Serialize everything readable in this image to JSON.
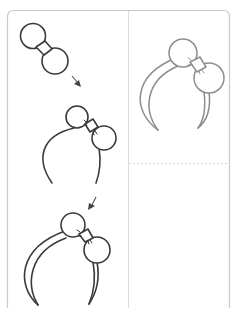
{
  "worksheet": {
    "subject": "how to draw a headband with bow",
    "steps": [
      {
        "index": 1,
        "description": "bow-two-circles-with-knot"
      },
      {
        "index": 2,
        "description": "add-single-line-headband-arc"
      },
      {
        "index": 3,
        "description": "double-line-headband"
      }
    ],
    "final_preview": {
      "description": "finished-headband-grey-outline"
    },
    "arrows": [
      {
        "from_step": 1,
        "to_step": 2,
        "icon": "arrow-down-right-icon"
      },
      {
        "from_step": 2,
        "to_step": 3,
        "icon": "arrow-down-left-icon"
      }
    ],
    "practice_area": {
      "description": "blank-drawing-space"
    }
  },
  "colors": {
    "ink": "#3a3a3a",
    "preview_ink": "#8d8d8d",
    "frame": "#c9c9c9",
    "background": "#ffffff"
  }
}
